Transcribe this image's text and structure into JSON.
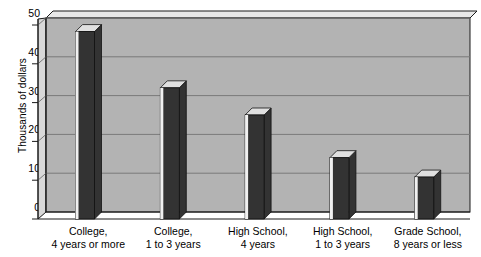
{
  "chart_data": {
    "type": "bar",
    "title": "",
    "subtitle": "",
    "xlabel": "",
    "ylabel": "Thousands of dollars",
    "ylim": [
      0,
      50
    ],
    "yticks": [
      0,
      10,
      20,
      30,
      40,
      50
    ],
    "ytick_labels": [
      "0",
      "10",
      "20",
      "30",
      "40",
      "50"
    ],
    "grid": true,
    "grid_axis": "y",
    "legend": false,
    "legend_position": "none",
    "style": "3d-bar",
    "categories": [
      "College, 4 years or more",
      "College, 1 to 3 years",
      "High School, 4 years",
      "High School, 1 to 3 years",
      "Grade School, 8 years or less"
    ],
    "category_lines": [
      [
        "College,",
        "4 years or more"
      ],
      [
        "College,",
        "1 to 3 years"
      ],
      [
        "High School,",
        "4 years"
      ],
      [
        "High School,",
        "1 to 3 years"
      ],
      [
        "Grade School,",
        "8 years or less"
      ]
    ],
    "values": [
      46.5,
      32,
      25,
      14,
      9
    ],
    "series": [
      {
        "name": "Median income",
        "values": [
          46.5,
          32,
          25,
          14,
          9
        ]
      }
    ]
  },
  "colors": {
    "plot_background": "#b3b3b3",
    "plot_side": "#d8d8d8",
    "plot_top": "#e8e8e8",
    "bar_face": "#333333",
    "bar_top": "#e0e0e0",
    "bar_side": "#f0f0f0",
    "gridline": "#7a7a7a",
    "axis_line": "#1a1a1a",
    "text": "#000000",
    "page_background": "#ffffff"
  }
}
